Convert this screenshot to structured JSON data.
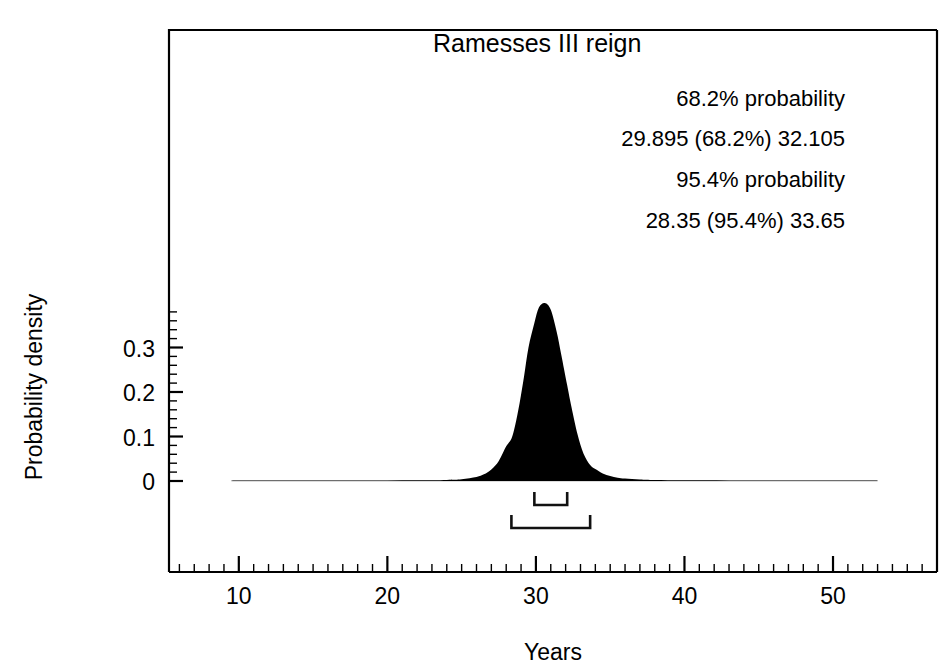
{
  "chart_data": {
    "type": "area",
    "title": "Ramesses III reign",
    "xlabel": "Years",
    "ylabel": "Probability density",
    "xlim": [
      5.3,
      57.0
    ],
    "ylim": [
      0,
      0.42
    ],
    "grid": false,
    "legend": "none",
    "x_ticks_major": [
      10,
      20,
      30,
      40,
      50
    ],
    "x_tick_labels": [
      "10",
      "20",
      "30",
      "40",
      "50"
    ],
    "x_ticks_minor_step": 1,
    "y_ticks_major": [
      0,
      0.1,
      0.2,
      0.3
    ],
    "y_tick_labels": [
      "0",
      "0.1",
      "0.2",
      "0.3"
    ],
    "y_ticks_minor_step": 0.02,
    "peak_x": 30.6,
    "peak_y": 0.4,
    "curve_sigma_left": 0.95,
    "curve_sigma_right": 1.25,
    "series": [
      {
        "name": "Probability density",
        "color": "#000000",
        "x": [
          9.5,
          12,
          14,
          16,
          18,
          20,
          22,
          24,
          25,
          26,
          26.5,
          27,
          27.5,
          28,
          28.35,
          28.6,
          28.9,
          29.2,
          29.5,
          29.895,
          30.2,
          30.6,
          31.0,
          31.4,
          31.7,
          32.105,
          32.4,
          32.8,
          33.2,
          33.65,
          34,
          34.5,
          35,
          35.5,
          36,
          37,
          38,
          40,
          43,
          47,
          52,
          53
        ],
        "values": [
          0.0008,
          0.0009,
          0.001,
          0.0011,
          0.0012,
          0.0013,
          0.0016,
          0.0025,
          0.004,
          0.009,
          0.015,
          0.026,
          0.045,
          0.078,
          0.095,
          0.125,
          0.175,
          0.235,
          0.3,
          0.355,
          0.39,
          0.4,
          0.385,
          0.335,
          0.285,
          0.215,
          0.165,
          0.105,
          0.062,
          0.036,
          0.027,
          0.017,
          0.011,
          0.0075,
          0.0055,
          0.0033,
          0.0022,
          0.0015,
          0.0012,
          0.001,
          0.0009,
          0.0008
        ]
      }
    ],
    "annotations": {
      "line_1": "68.2% probability",
      "line_2": "29.895 (68.2%) 32.105",
      "line_3": "95.4% probability",
      "line_4": "28.35 (95.4%) 33.65"
    },
    "ranges": [
      {
        "name": "68.2% range",
        "probability": "68.2%",
        "from": 29.895,
        "to": 32.105,
        "label": "29.895 (68.2%) 32.105"
      },
      {
        "name": "95.4% range",
        "probability": "95.4%",
        "from": 28.35,
        "to": 33.65,
        "label": "28.35 (95.4%) 33.65"
      }
    ]
  },
  "colors": {
    "distribution": "#000000",
    "axis": "#000000",
    "background": "#ffffff",
    "bracket": "#111111"
  }
}
